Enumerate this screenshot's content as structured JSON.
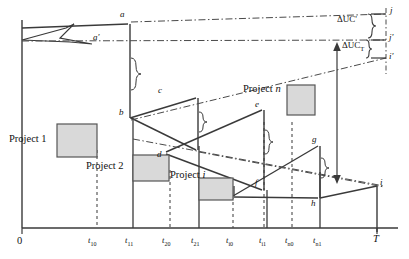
{
  "diagram": {
    "type": "technical-line-diagram",
    "axes": {
      "x_origin_label": "0",
      "x_end_label": "T",
      "tick_labels": [
        {
          "id": "t10",
          "text": "t",
          "sub": "10",
          "x": 94
        },
        {
          "id": "t11",
          "text": "t",
          "sub": "11",
          "x": 131
        },
        {
          "id": "t20",
          "text": "t",
          "sub": "20",
          "x": 168
        },
        {
          "id": "t21",
          "text": "t",
          "sub": "21",
          "x": 196
        },
        {
          "id": "ti0",
          "text": "t",
          "sub": "i0",
          "x": 231
        },
        {
          "id": "ti1",
          "text": "t",
          "sub": "i1",
          "x": 264
        },
        {
          "id": "tn0",
          "text": "t",
          "sub": "n0",
          "x": 290
        },
        {
          "id": "tn1",
          "text": "t",
          "sub": "n1",
          "x": 318
        }
      ]
    },
    "point_labels": [
      {
        "id": "a",
        "text": "a"
      },
      {
        "id": "ap",
        "text": "a'"
      },
      {
        "id": "b",
        "text": "b"
      },
      {
        "id": "c",
        "text": "c"
      },
      {
        "id": "d",
        "text": "d"
      },
      {
        "id": "e",
        "text": "e"
      },
      {
        "id": "f",
        "text": "f"
      },
      {
        "id": "g",
        "text": "g"
      },
      {
        "id": "h",
        "text": "h"
      },
      {
        "id": "i",
        "text": "i"
      },
      {
        "id": "ip",
        "text": "i'"
      },
      {
        "id": "j",
        "text": "j"
      },
      {
        "id": "jp",
        "text": "j'"
      }
    ],
    "project_labels": [
      {
        "id": "project-1",
        "text": "Project 1"
      },
      {
        "id": "project-2",
        "text": "Project 2"
      },
      {
        "id": "project-i",
        "text": "Project i"
      },
      {
        "id": "project-n",
        "text": "Project n"
      }
    ],
    "measures": [
      {
        "id": "delta-uc-prime",
        "text": "ΔUC'",
        "sub": ""
      },
      {
        "id": "delta-uc",
        "text": "ΔUC",
        "sub": "T"
      }
    ],
    "colors": {
      "line": "#3a3a3a",
      "fill": "#d9d9d9",
      "fill_border": "#555555",
      "dashed": "#5a5a5a",
      "text": "#111111",
      "background": "#ffffff"
    }
  }
}
